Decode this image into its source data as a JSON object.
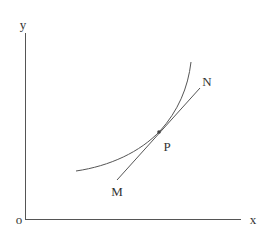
{
  "diagram": {
    "type": "tangent-to-curve",
    "colors": {
      "stroke": "#555555",
      "text": "#333333",
      "background": "#ffffff"
    },
    "labels": {
      "y_axis": "y",
      "x_axis": "x",
      "origin": "o",
      "point": "P",
      "line_start": "M",
      "line_end": "N"
    },
    "elements": [
      "y-axis (vertical)",
      "x-axis (horizontal)",
      "convex increasing curve",
      "tangent line MN touching curve at P"
    ]
  }
}
